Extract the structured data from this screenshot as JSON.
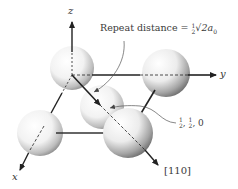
{
  "diagram": {
    "type": "crystal-lattice-direction",
    "axes": {
      "x": "x",
      "y": "y",
      "z": "z"
    },
    "annotations": {
      "repeat_distance_label": "Repeat distance = ",
      "repeat_distance_value": "√2a",
      "repeat_distance_fraction_num": "1",
      "repeat_distance_fraction_den": "2",
      "repeat_distance_subscript": "0",
      "position_label_frac1_num": "1",
      "position_label_frac1_den": "2",
      "position_label_frac2_num": "1",
      "position_label_frac2_den": "2",
      "position_label_tail": ", 0",
      "direction_label": "[110]"
    },
    "atoms": [
      {
        "name": "origin-atom",
        "position": "0,0,0"
      },
      {
        "name": "y-axis-atom",
        "position": "0,1,0"
      },
      {
        "name": "face-center-atom",
        "position": "1/2,1/2,0"
      },
      {
        "name": "x-axis-atom",
        "position": "1,0,0"
      },
      {
        "name": "corner-110-atom",
        "position": "1,1,0"
      }
    ],
    "colors": {
      "line": "#222222",
      "sphere_light": "#ffffff",
      "sphere_dark": "#8a8a8a",
      "text": "#333333"
    }
  }
}
